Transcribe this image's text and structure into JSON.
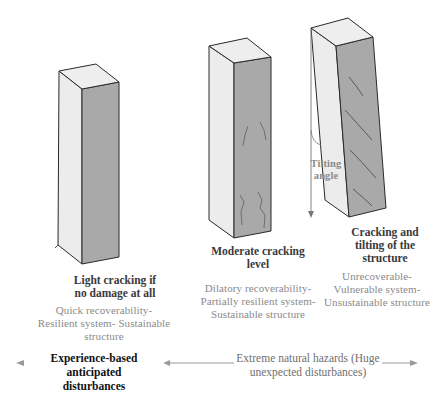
{
  "diagram": {
    "colors": {
      "face_light": "#ececec",
      "face_dark": "#a9a9a9",
      "face_top": "#eeeeee",
      "edge": "#2a2a2a",
      "crack": "#555555",
      "arrow": "#9a9a9a",
      "tilt_line": "#777777"
    },
    "columns": [
      {
        "id": "light",
        "title": "Light cracking if no damage at all",
        "title_lines": [
          "Light cracking if",
          "no damage at all"
        ],
        "description_lines": [
          "Quick recoverability-",
          "Resilient system- Sustainable",
          "structure"
        ]
      },
      {
        "id": "moderate",
        "title": "Moderate cracking level",
        "title_lines": [
          "Moderate cracking",
          "level"
        ],
        "description_lines": [
          "Dilatory recoverability-",
          "Partially resilient system-",
          "Sustainable structure"
        ]
      },
      {
        "id": "tilting",
        "title": "Cracking and tilting of the structure",
        "title_lines": [
          "Cracking and",
          "tilting of the",
          "structure"
        ],
        "description_lines": [
          "Unrecoverable-",
          "Vulnerable system-",
          "Unsustainable structure"
        ]
      }
    ],
    "tilt_annotation": {
      "lines": [
        "Tilting",
        "angle"
      ]
    },
    "ranges": [
      {
        "id": "anticipated",
        "label_lines": [
          "Experience-based anticipated",
          "disturbances"
        ]
      },
      {
        "id": "extreme",
        "label_lines": [
          "Extreme natural hazards (Huge",
          "unexpected disturbances)"
        ]
      }
    ]
  }
}
